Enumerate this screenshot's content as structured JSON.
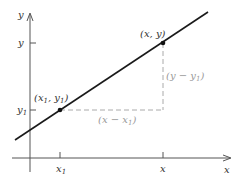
{
  "diagram": {
    "type": "point-slope line diagram",
    "axes": {
      "x_axis_label": "x",
      "y_axis_label": "y",
      "x_ticks": [
        {
          "label": "x",
          "sub": "1"
        },
        {
          "label": "x",
          "sub": ""
        }
      ],
      "y_ticks": [
        {
          "label": "y",
          "sub": ""
        },
        {
          "label": "y",
          "sub": "1"
        }
      ]
    },
    "points": [
      {
        "name": "point-x1-y1",
        "label_open": "(x",
        "label_sub1": "1",
        "label_mid": ", y",
        "label_sub2": "1",
        "label_close": ")"
      },
      {
        "name": "point-x-y",
        "label": "(x, y)"
      }
    ],
    "run_label": {
      "open": "(x − x",
      "sub": "1",
      "close": ")"
    },
    "rise_label": {
      "open": "(y − y",
      "sub": "1",
      "close": ")"
    },
    "colors": {
      "line": "#1a1a1a",
      "axes": "#555555",
      "dashed": "#aaaaaa",
      "label_grey": "#9a9a9a"
    }
  }
}
